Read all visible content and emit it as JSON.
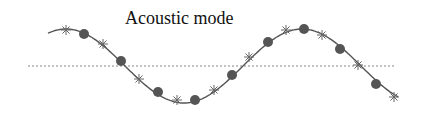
{
  "diagram": {
    "title": "Acoustic mode",
    "colors": {
      "curve": "#555555",
      "baseline": "#888888",
      "circle_fill": "#555555",
      "star": "#666666",
      "background": "#ffffff"
    },
    "baseline": {
      "y": 66,
      "x1": 28,
      "x2": 396
    },
    "curve": {
      "x_start": 48,
      "x_end": 398,
      "center_y": 66,
      "amplitude": 37,
      "wavelength": 236,
      "peak_x": 66
    },
    "star_markers": [
      {
        "x": 66,
        "y": 30
      },
      {
        "x": 103,
        "y": 44
      },
      {
        "x": 139,
        "y": 79
      },
      {
        "x": 177,
        "y": 100
      },
      {
        "x": 214,
        "y": 90
      },
      {
        "x": 249,
        "y": 57
      },
      {
        "x": 286,
        "y": 30
      },
      {
        "x": 322,
        "y": 35
      },
      {
        "x": 358,
        "y": 65
      },
      {
        "x": 394,
        "y": 97
      }
    ],
    "circle_markers": [
      {
        "x": 84,
        "y": 34
      },
      {
        "x": 121,
        "y": 61
      },
      {
        "x": 158,
        "y": 92
      },
      {
        "x": 195,
        "y": 100
      },
      {
        "x": 232,
        "y": 75
      },
      {
        "x": 268,
        "y": 42
      },
      {
        "x": 304,
        "y": 29
      },
      {
        "x": 340,
        "y": 49
      },
      {
        "x": 376,
        "y": 84
      }
    ]
  }
}
